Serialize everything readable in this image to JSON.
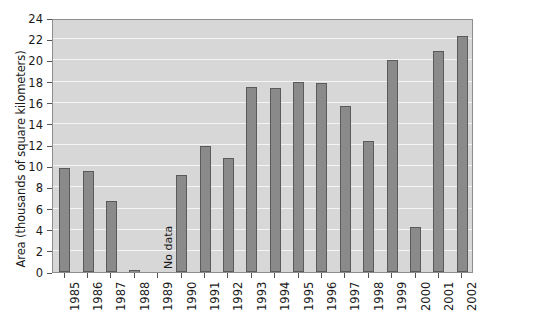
{
  "chart_data": {
    "type": "bar",
    "title": "",
    "xlabel": "",
    "ylabel": "Area (thousands of square kilometers)",
    "ylim": [
      0,
      24
    ],
    "ytick_values": [
      0,
      2,
      4,
      6,
      8,
      10,
      12,
      14,
      16,
      18,
      20,
      22,
      24
    ],
    "ytick_labels": [
      "0",
      "2",
      "4",
      "6",
      "8",
      "10",
      "12",
      "14",
      "16",
      "18",
      "20",
      "22",
      "24"
    ],
    "grid": true,
    "legend": "none",
    "categories": [
      "1985",
      "1986",
      "1987",
      "1988",
      "1989",
      "1990",
      "1991",
      "1992",
      "1993",
      "1994",
      "1995",
      "1996",
      "1997",
      "1998",
      "1999",
      "2000",
      "2001",
      "2002"
    ],
    "values": [
      9.8,
      9.5,
      6.7,
      0.1,
      null,
      9.2,
      11.9,
      10.8,
      17.5,
      17.4,
      18.0,
      17.9,
      15.7,
      12.4,
      20.0,
      4.3,
      20.9,
      22.3
    ],
    "annotations": [
      {
        "category": "1989",
        "text": "No data",
        "rotation": 90
      }
    ],
    "colors": {
      "bar_fill": "#8a8a8a",
      "bar_border": "#5a5a5a",
      "plot_background": "#d7d7d7",
      "gridline": "#f4f4f4",
      "axis": "#8d8d8d",
      "text": "#1a1a1a",
      "page_background": "#ffffff"
    }
  }
}
